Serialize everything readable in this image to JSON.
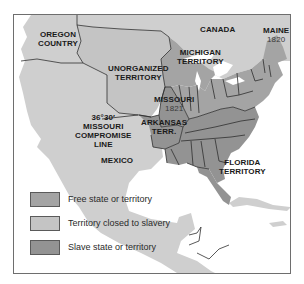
{
  "map": {
    "colors": {
      "free": "#a4a4a4",
      "closed": "#c4c4c4",
      "slave": "#939393",
      "other_land": "#cfcfcf",
      "water": "#ffffff",
      "border": "#2e2e2e",
      "frame": "#6e6e6e"
    },
    "labels": {
      "oregon": [
        "OREGON",
        "COUNTRY"
      ],
      "canada": "CANADA",
      "maine": "MAINE",
      "maine_year": "1820",
      "michigan": [
        "MICHIGAN",
        "TERRITORY"
      ],
      "unorganized": [
        "UNORGANIZED",
        "TERRITORY"
      ],
      "missouri": "MISSOURI",
      "missouri_year": "1821",
      "arkansas": [
        "ARKANSAS",
        "TERR."
      ],
      "compromise": [
        "36°30′",
        "MISSOURI",
        "COMPROMISE",
        "LINE"
      ],
      "mexico": "MEXICO",
      "florida": [
        "FLORIDA",
        "TERRITORY"
      ]
    },
    "legend": [
      {
        "key": "free",
        "label": "Free state or territory"
      },
      {
        "key": "closed",
        "label": "Territory closed to slavery"
      },
      {
        "key": "slave",
        "label": "Slave state or territory"
      }
    ]
  }
}
